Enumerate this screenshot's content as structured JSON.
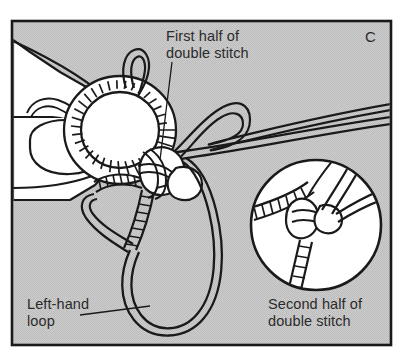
{
  "figure": {
    "panel_letter": "C",
    "labels": {
      "first_half": "First half of\ndouble stitch",
      "left_hand_loop": "Left-hand\nloop",
      "second_half": "Second half of\ndouble stitch"
    },
    "colors": {
      "background": "#ffffff",
      "panel_fill": "#c9c9c9",
      "frame_stroke": "#1a1a1a",
      "ink": "#1a1a1a",
      "cord_fill": "#ffffff",
      "text": "#2b2b2b"
    },
    "frame": {
      "x": 12,
      "y": 21,
      "width": 379,
      "height": 324,
      "stroke_width": 2.6
    },
    "elements": [
      {
        "name": "hand",
        "description": "left hand holding cord, white with black outline"
      },
      {
        "name": "coiled-ring",
        "description": "cord ring wrapped with tight coils"
      },
      {
        "name": "small-top-loop",
        "description": "narrow loop rising from top of ring"
      },
      {
        "name": "knot-center",
        "description": "interlocking double stitch knot"
      },
      {
        "name": "working-cords",
        "description": "two parallel cords exiting right edge"
      },
      {
        "name": "large-loop",
        "description": "large left-hand loop of cord at bottom"
      },
      {
        "name": "inset-circle",
        "description": "magnified detail circle, second half of double stitch"
      }
    ],
    "inset": {
      "cx": 316,
      "cy": 225,
      "r": 65
    }
  }
}
